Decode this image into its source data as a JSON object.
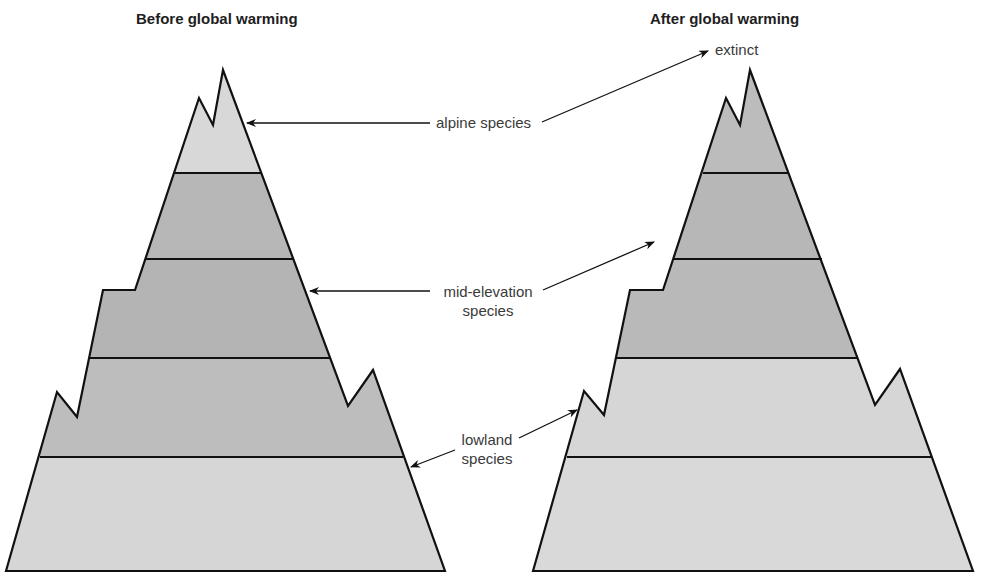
{
  "titles": {
    "before": "Before global warming",
    "after": "After global warming"
  },
  "labels": {
    "alpine": "alpine species",
    "mid_line1": "mid-elevation",
    "mid_line2": "species",
    "lowland_line1": "lowland",
    "lowland_line2": "species",
    "extinct": "extinct"
  },
  "colors": {
    "light_band": "#d9d9d9",
    "dark_band": "#b9b9b9",
    "outline": "#111111",
    "background": "#ffffff",
    "text": "#3a3a3a"
  },
  "bands": {
    "before": [
      "alpine (light)",
      "mid-elevation (dark)",
      "mid-elevation (dark)",
      "lowland (dark)",
      "lowland (light)"
    ],
    "after": [
      "mid-elevation (dark)",
      "mid-elevation (dark)",
      "mid-elevation (dark)",
      "lowland (light)",
      "lowland (light)"
    ]
  }
}
